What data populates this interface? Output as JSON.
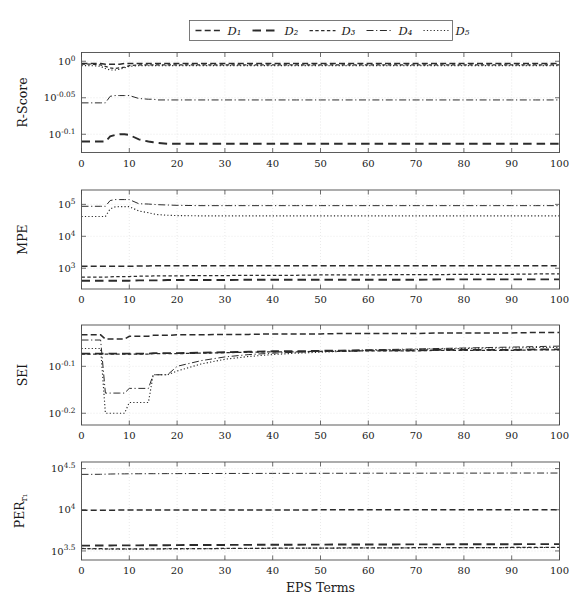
{
  "figure": {
    "xlabel": "EPS Terms",
    "legend": {
      "position": "top-center",
      "entries": [
        {
          "label": "D₁",
          "name": "D1",
          "dash": "dashed"
        },
        {
          "label": "D₂",
          "name": "D2",
          "dash": "long-dash"
        },
        {
          "label": "D₃",
          "name": "D3",
          "dash": "short-dash"
        },
        {
          "label": "D₄",
          "name": "D4",
          "dash": "dash-dot"
        },
        {
          "label": "D₅",
          "name": "D5",
          "dash": "dotted"
        }
      ]
    },
    "xticks": [
      "0",
      "10",
      "20",
      "30",
      "40",
      "50",
      "60",
      "70",
      "80",
      "90",
      "100"
    ],
    "xlim": [
      0,
      100
    ]
  },
  "chart_data": [
    {
      "type": "line",
      "panel": "R-Score",
      "title": "",
      "ylabel": "R-Score",
      "xlabel": "",
      "yscale": "log",
      "xlim": [
        0,
        100
      ],
      "ylim": [
        -0.125,
        0.012
      ],
      "ytick_labels": [
        "10^0",
        "10^-0.05",
        "10^-0.1"
      ],
      "ytick_values": [
        0,
        -0.05,
        -0.1
      ],
      "grid": true,
      "x": [
        0,
        2,
        4,
        5,
        6,
        7,
        8,
        9,
        10,
        12,
        14,
        15,
        16,
        18,
        20,
        25,
        30,
        35,
        40,
        45,
        50,
        55,
        60,
        65,
        70,
        75,
        80,
        85,
        90,
        95,
        100
      ],
      "series": [
        {
          "name": "D1",
          "values": [
            -0.003,
            -0.003,
            -0.003,
            -0.004,
            -0.004,
            -0.004,
            -0.004,
            -0.003,
            -0.003,
            -0.003,
            -0.003,
            -0.003,
            -0.003,
            -0.003,
            -0.003,
            -0.003,
            -0.003,
            -0.003,
            -0.003,
            -0.003,
            -0.003,
            -0.003,
            -0.003,
            -0.003,
            -0.003,
            -0.003,
            -0.003,
            -0.003,
            -0.003,
            -0.003,
            -0.003
          ]
        },
        {
          "name": "D2",
          "values": [
            -0.11,
            -0.11,
            -0.11,
            -0.11,
            -0.103,
            -0.101,
            -0.1,
            -0.1,
            -0.101,
            -0.107,
            -0.11,
            -0.111,
            -0.112,
            -0.113,
            -0.113,
            -0.113,
            -0.113,
            -0.113,
            -0.113,
            -0.113,
            -0.113,
            -0.113,
            -0.113,
            -0.113,
            -0.113,
            -0.113,
            -0.113,
            -0.113,
            -0.113,
            -0.113,
            -0.113
          ]
        },
        {
          "name": "D3",
          "values": [
            -0.004,
            -0.004,
            -0.005,
            -0.007,
            -0.009,
            -0.01,
            -0.009,
            -0.008,
            -0.006,
            -0.005,
            -0.005,
            -0.005,
            -0.005,
            -0.005,
            -0.005,
            -0.005,
            -0.005,
            -0.005,
            -0.005,
            -0.005,
            -0.005,
            -0.005,
            -0.005,
            -0.005,
            -0.005,
            -0.005,
            -0.005,
            -0.005,
            -0.005,
            -0.005,
            -0.005
          ]
        },
        {
          "name": "D4",
          "values": [
            -0.057,
            -0.057,
            -0.057,
            -0.057,
            -0.048,
            -0.047,
            -0.047,
            -0.047,
            -0.047,
            -0.051,
            -0.052,
            -0.052,
            -0.053,
            -0.053,
            -0.053,
            -0.053,
            -0.053,
            -0.053,
            -0.053,
            -0.053,
            -0.053,
            -0.053,
            -0.053,
            -0.053,
            -0.053,
            -0.053,
            -0.053,
            -0.053,
            -0.053,
            -0.053,
            -0.053
          ]
        },
        {
          "name": "D5",
          "values": [
            -0.006,
            -0.006,
            -0.007,
            -0.01,
            -0.012,
            -0.012,
            -0.011,
            -0.009,
            -0.007,
            -0.006,
            -0.006,
            -0.006,
            -0.006,
            -0.006,
            -0.006,
            -0.006,
            -0.006,
            -0.006,
            -0.006,
            -0.006,
            -0.006,
            -0.006,
            -0.006,
            -0.006,
            -0.006,
            -0.006,
            -0.006,
            -0.006,
            -0.006,
            -0.006,
            -0.006
          ]
        }
      ]
    },
    {
      "type": "line",
      "panel": "MPE",
      "title": "",
      "ylabel": "MPE",
      "xlabel": "",
      "yscale": "log",
      "xlim": [
        0,
        100
      ],
      "ylim": [
        2.35,
        5.45
      ],
      "ytick_labels": [
        "10^5",
        "10^4",
        "10^3"
      ],
      "ytick_values": [
        5,
        4,
        3
      ],
      "grid": true,
      "x": [
        0,
        2,
        4,
        5,
        6,
        7,
        8,
        9,
        10,
        12,
        14,
        15,
        16,
        18,
        20,
        25,
        30,
        35,
        40,
        45,
        50,
        55,
        60,
        65,
        70,
        75,
        80,
        85,
        90,
        95,
        100
      ],
      "series": [
        {
          "name": "D1",
          "values": [
            3.06,
            3.06,
            3.06,
            3.06,
            3.06,
            3.06,
            3.06,
            3.06,
            3.06,
            3.07,
            3.07,
            3.08,
            3.08,
            3.08,
            3.08,
            3.08,
            3.08,
            3.08,
            3.08,
            3.08,
            3.08,
            3.08,
            3.08,
            3.08,
            3.08,
            3.08,
            3.08,
            3.08,
            3.08,
            3.08,
            3.08
          ]
        },
        {
          "name": "D2",
          "values": [
            2.61,
            2.61,
            2.61,
            2.61,
            2.61,
            2.61,
            2.61,
            2.61,
            2.61,
            2.62,
            2.62,
            2.62,
            2.62,
            2.63,
            2.63,
            2.63,
            2.63,
            2.64,
            2.64,
            2.64,
            2.64,
            2.64,
            2.64,
            2.64,
            2.64,
            2.65,
            2.65,
            2.65,
            2.65,
            2.65,
            2.65
          ]
        },
        {
          "name": "D3",
          "values": [
            2.72,
            2.72,
            2.72,
            2.72,
            2.73,
            2.74,
            2.74,
            2.74,
            2.74,
            2.75,
            2.75,
            2.76,
            2.76,
            2.76,
            2.76,
            2.77,
            2.77,
            2.78,
            2.78,
            2.78,
            2.79,
            2.79,
            2.79,
            2.8,
            2.8,
            2.8,
            2.81,
            2.81,
            2.81,
            2.82,
            2.82
          ]
        },
        {
          "name": "D4",
          "values": [
            4.94,
            4.94,
            4.94,
            4.94,
            5.12,
            5.15,
            5.15,
            5.15,
            5.15,
            5.02,
            5.01,
            5.0,
            4.99,
            4.98,
            4.97,
            4.96,
            4.96,
            4.96,
            4.96,
            4.96,
            4.96,
            4.96,
            4.96,
            4.96,
            4.96,
            4.96,
            4.96,
            4.96,
            4.96,
            4.96,
            4.96
          ]
        },
        {
          "name": "D5",
          "values": [
            4.62,
            4.62,
            4.62,
            4.62,
            4.86,
            4.92,
            4.93,
            4.93,
            4.93,
            4.79,
            4.74,
            4.7,
            4.68,
            4.66,
            4.65,
            4.64,
            4.64,
            4.64,
            4.64,
            4.64,
            4.64,
            4.64,
            4.64,
            4.64,
            4.64,
            4.64,
            4.64,
            4.64,
            4.64,
            4.64,
            4.64
          ]
        }
      ]
    },
    {
      "type": "line",
      "panel": "SEI",
      "title": "",
      "ylabel": "SEI",
      "xlabel": "",
      "yscale": "log",
      "xlim": [
        0,
        100
      ],
      "ylim": [
        -0.225,
        -0.012
      ],
      "ytick_labels": [
        "10^-0.1",
        "10^-0.2"
      ],
      "ytick_values": [
        -0.1,
        -0.2
      ],
      "grid": true,
      "x": [
        0,
        2,
        4,
        5,
        6,
        7,
        8,
        9,
        10,
        12,
        14,
        15,
        16,
        18,
        20,
        25,
        30,
        35,
        40,
        45,
        50,
        55,
        60,
        65,
        70,
        75,
        80,
        85,
        90,
        95,
        100
      ],
      "series": [
        {
          "name": "D1",
          "values": [
            -0.033,
            -0.033,
            -0.033,
            -0.042,
            -0.042,
            -0.042,
            -0.042,
            -0.042,
            -0.036,
            -0.036,
            -0.036,
            -0.034,
            -0.034,
            -0.034,
            -0.033,
            -0.033,
            -0.032,
            -0.032,
            -0.031,
            -0.031,
            -0.031,
            -0.03,
            -0.03,
            -0.03,
            -0.03,
            -0.029,
            -0.029,
            -0.029,
            -0.029,
            -0.028,
            -0.028
          ]
        },
        {
          "name": "D2",
          "values": [
            -0.073,
            -0.073,
            -0.073,
            -0.073,
            -0.073,
            -0.073,
            -0.073,
            -0.073,
            -0.073,
            -0.073,
            -0.073,
            -0.072,
            -0.072,
            -0.072,
            -0.072,
            -0.071,
            -0.07,
            -0.069,
            -0.068,
            -0.068,
            -0.067,
            -0.067,
            -0.066,
            -0.066,
            -0.066,
            -0.065,
            -0.065,
            -0.065,
            -0.065,
            -0.064,
            -0.064
          ]
        },
        {
          "name": "D3",
          "values": [
            -0.074,
            -0.074,
            -0.074,
            -0.074,
            -0.074,
            -0.074,
            -0.074,
            -0.074,
            -0.074,
            -0.074,
            -0.074,
            -0.073,
            -0.073,
            -0.073,
            -0.073,
            -0.072,
            -0.071,
            -0.07,
            -0.069,
            -0.069,
            -0.068,
            -0.068,
            -0.067,
            -0.067,
            -0.067,
            -0.066,
            -0.066,
            -0.066,
            -0.066,
            -0.065,
            -0.065
          ]
        },
        {
          "name": "D4",
          "values": [
            -0.044,
            -0.044,
            -0.044,
            -0.157,
            -0.157,
            -0.157,
            -0.157,
            -0.157,
            -0.147,
            -0.147,
            -0.147,
            -0.118,
            -0.118,
            -0.118,
            -0.1,
            -0.088,
            -0.08,
            -0.075,
            -0.072,
            -0.07,
            -0.068,
            -0.066,
            -0.065,
            -0.064,
            -0.063,
            -0.062,
            -0.061,
            -0.06,
            -0.059,
            -0.058,
            -0.057
          ]
        },
        {
          "name": "D5",
          "values": [
            -0.062,
            -0.062,
            -0.062,
            -0.2,
            -0.2,
            -0.2,
            -0.2,
            -0.2,
            -0.177,
            -0.177,
            -0.177,
            -0.118,
            -0.118,
            -0.118,
            -0.11,
            -0.095,
            -0.085,
            -0.079,
            -0.075,
            -0.072,
            -0.07,
            -0.068,
            -0.066,
            -0.065,
            -0.064,
            -0.063,
            -0.062,
            -0.061,
            -0.061,
            -0.06,
            -0.06
          ]
        }
      ]
    },
    {
      "type": "line",
      "panel": "PER",
      "title": "",
      "ylabel": "PER",
      "ylabel_sub": "r₁",
      "xlabel": "EPS Terms",
      "yscale": "log",
      "xlim": [
        0,
        100
      ],
      "ylim": [
        3.39,
        4.58
      ],
      "ytick_labels": [
        "10^4.5",
        "10^4",
        "10^3.5"
      ],
      "ytick_values": [
        4.5,
        4.0,
        3.5
      ],
      "grid": true,
      "x": [
        0,
        2,
        4,
        5,
        6,
        7,
        8,
        9,
        10,
        12,
        14,
        15,
        16,
        18,
        20,
        25,
        30,
        35,
        40,
        45,
        50,
        55,
        60,
        65,
        70,
        75,
        80,
        85,
        90,
        95,
        100
      ],
      "series": [
        {
          "name": "D1",
          "values": [
            3.995,
            3.995,
            3.995,
            3.995,
            3.995,
            3.995,
            3.996,
            3.996,
            3.996,
            3.996,
            3.996,
            3.997,
            3.997,
            3.997,
            3.997,
            3.997,
            3.998,
            3.998,
            3.998,
            3.998,
            3.999,
            3.999,
            3.999,
            3.999,
            4.0,
            4.0,
            4.0,
            4.0,
            4.001,
            4.001,
            4.001
          ]
        },
        {
          "name": "D2",
          "values": [
            3.565,
            3.565,
            3.566,
            3.566,
            3.566,
            3.567,
            3.567,
            3.567,
            3.568,
            3.568,
            3.569,
            3.569,
            3.57,
            3.57,
            3.571,
            3.572,
            3.573,
            3.574,
            3.575,
            3.576,
            3.577,
            3.578,
            3.578,
            3.579,
            3.58,
            3.58,
            3.581,
            3.582,
            3.582,
            3.583,
            3.583
          ]
        },
        {
          "name": "D3",
          "values": [
            3.53,
            3.528,
            3.527,
            3.526,
            3.526,
            3.525,
            3.525,
            3.525,
            3.525,
            3.525,
            3.526,
            3.526,
            3.526,
            3.527,
            3.527,
            3.529,
            3.53,
            3.532,
            3.533,
            3.534,
            3.535,
            3.536,
            3.537,
            3.538,
            3.539,
            3.54,
            3.54,
            3.541,
            3.542,
            3.542,
            3.543
          ]
        },
        {
          "name": "D4",
          "values": [
            4.43,
            4.43,
            4.431,
            4.432,
            4.434,
            4.435,
            4.436,
            4.436,
            4.437,
            4.437,
            4.438,
            4.438,
            4.438,
            4.439,
            4.439,
            4.44,
            4.441,
            4.441,
            4.442,
            4.442,
            4.443,
            4.443,
            4.444,
            4.444,
            4.444,
            4.445,
            4.445,
            4.445,
            4.446,
            4.446,
            4.446
          ]
        },
        {
          "name": "D5",
          "values": [
            3.528,
            3.526,
            3.524,
            3.523,
            3.522,
            3.522,
            3.522,
            3.522,
            3.522,
            3.523,
            3.523,
            3.524,
            3.524,
            3.525,
            3.525,
            3.527,
            3.529,
            3.53,
            3.532,
            3.533,
            3.534,
            3.535,
            3.536,
            3.537,
            3.538,
            3.539,
            3.539,
            3.54,
            3.541,
            3.541,
            3.542
          ]
        }
      ]
    }
  ]
}
